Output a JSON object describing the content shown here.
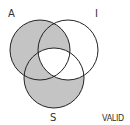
{
  "diagram": {
    "type": "venn-3",
    "labels": {
      "a": "A",
      "i": "I",
      "s": "S",
      "verdict": "VALID"
    },
    "circles": [
      {
        "id": "A",
        "cx": 40,
        "cy": 50,
        "r": 30
      },
      {
        "id": "I",
        "cx": 68,
        "cy": 50,
        "r": 30
      },
      {
        "id": "S",
        "cx": 54,
        "cy": 78,
        "r": 30
      }
    ],
    "shaded_regions": [
      "A only",
      "A∩I not S",
      "A∩S not I",
      "S only"
    ],
    "unshaded_regions": [
      "I only",
      "I∩S not A",
      "A∩I∩S"
    ],
    "colors": {
      "shade": "#c4c4c4",
      "stroke": "#222222",
      "background": "#ffffff"
    }
  }
}
